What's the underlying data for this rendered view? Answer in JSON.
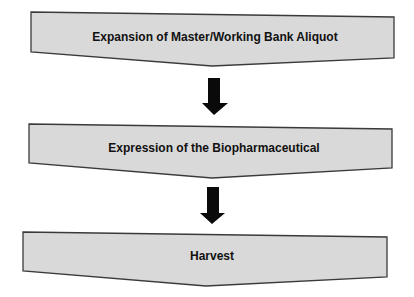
{
  "diagram": {
    "type": "process-flowchart",
    "colors": {
      "box_fill": "#d9d9d9",
      "box_stroke": "#3a3a3a",
      "arrow": "#0a0a0a",
      "text": "#111111",
      "background": "#ffffff"
    },
    "steps": [
      {
        "label": "Expansion of Master/Working Bank Aliquot"
      },
      {
        "label": "Expression of the Biopharmaceutical"
      },
      {
        "label": "Harvest"
      }
    ],
    "connections": [
      {
        "from": 0,
        "to": 1,
        "icon": "down-arrow-icon"
      },
      {
        "from": 1,
        "to": 2,
        "icon": "down-arrow-icon"
      }
    ]
  }
}
